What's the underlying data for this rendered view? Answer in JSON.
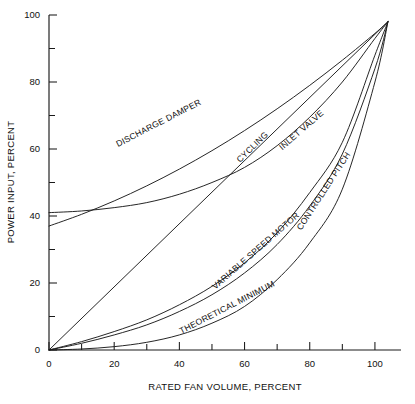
{
  "chart_data": {
    "type": "line",
    "title": "",
    "subtitle": "",
    "xlabel": "RATED FAN VOLUME, PERCENT",
    "ylabel": "POWER INPUT, PERCENT",
    "xlim": [
      0,
      108
    ],
    "ylim": [
      0,
      100
    ],
    "xticks": [
      0,
      10,
      20,
      30,
      40,
      50,
      60,
      70,
      80,
      90,
      100
    ],
    "xtick_labels": [
      "0",
      "",
      "20",
      "",
      "40",
      "",
      "60",
      "",
      "80",
      "",
      "100"
    ],
    "yticks": [
      0,
      10,
      20,
      30,
      40,
      50,
      60,
      70,
      80,
      90,
      100
    ],
    "ytick_labels": [
      "0",
      "",
      "20",
      "",
      "40",
      "",
      "60",
      "",
      "80",
      "",
      "100"
    ],
    "grid": false,
    "legend": "inline-curve-labels",
    "legend_position": "on-curve",
    "convergence_point": [
      104,
      98
    ],
    "series": [
      {
        "name": "DISCHARGE DAMPER",
        "label": "DISCHARGE DAMPER",
        "label_x": 34,
        "label_y": 67,
        "x": [
          0,
          10,
          20,
          30,
          40,
          50,
          60,
          70,
          80,
          90,
          100,
          104
        ],
        "y": [
          37,
          40.5,
          44.5,
          49,
          54,
          59.5,
          65.5,
          72,
          79,
          86.5,
          94.5,
          98
        ]
      },
      {
        "name": "INLET VALVE",
        "label": "INLET VALVE",
        "label_x": 78,
        "label_y": 65,
        "x": [
          0,
          10,
          20,
          30,
          40,
          50,
          60,
          70,
          80,
          90,
          100,
          104
        ],
        "y": [
          41,
          41.5,
          42.5,
          44,
          46.5,
          50,
          54.5,
          61,
          69.5,
          80,
          93,
          98
        ]
      },
      {
        "name": "CYCLING",
        "label": "CYCLING",
        "label_x": 63,
        "label_y": 60,
        "x": [
          0,
          104
        ],
        "y": [
          0,
          98
        ]
      },
      {
        "name": "CONTROLLED PITCH",
        "label": "CONTROLLED PITCH",
        "label_x": 85,
        "label_y": 47,
        "x": [
          0,
          10,
          20,
          30,
          40,
          50,
          60,
          70,
          80,
          90,
          100,
          104
        ],
        "y": [
          0,
          2.5,
          5.5,
          9,
          13.5,
          19,
          26,
          35,
          47,
          62,
          88,
          98
        ]
      },
      {
        "name": "VARIABLE SPEED MOTOR",
        "label": "VARIABLE SPEED MOTOR",
        "label_x": 64,
        "label_y": 29,
        "x": [
          0,
          10,
          20,
          30,
          40,
          50,
          60,
          70,
          80,
          90,
          100,
          104
        ],
        "y": [
          0,
          2,
          4.5,
          7.5,
          11.5,
          16.5,
          23,
          31.5,
          43,
          58.5,
          84,
          98
        ]
      },
      {
        "name": "THEORETICAL MINIMUM",
        "label": "THEORETICAL MINIMUM",
        "label_x": 55,
        "label_y": 12,
        "x": [
          0,
          10,
          20,
          30,
          40,
          50,
          60,
          70,
          80,
          90,
          100,
          104
        ],
        "y": [
          0,
          0.3,
          1.0,
          2.3,
          4.5,
          8.0,
          13.0,
          21.0,
          32.0,
          48.0,
          80.0,
          98
        ]
      }
    ]
  }
}
